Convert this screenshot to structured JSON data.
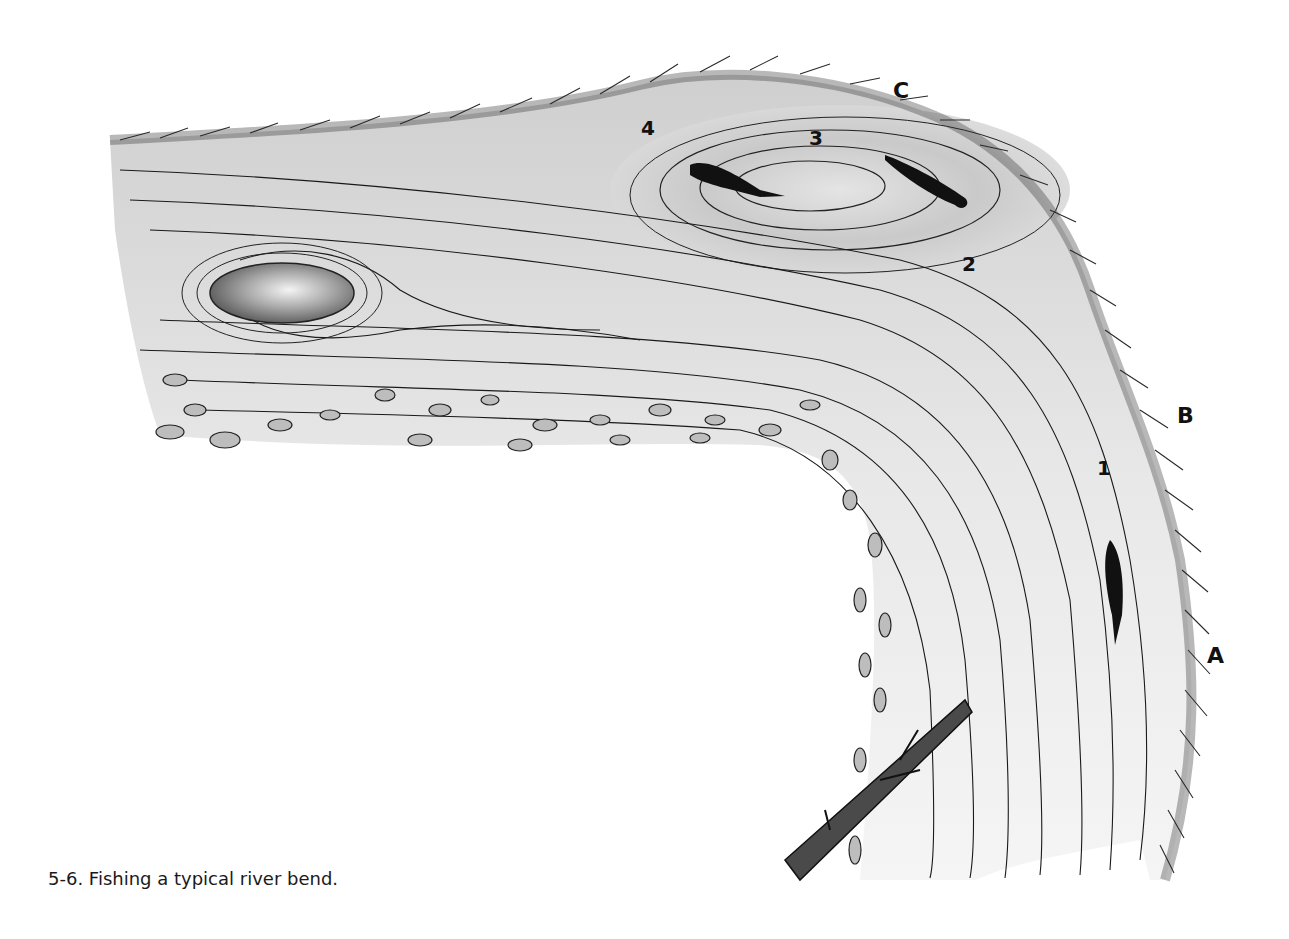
{
  "figure": {
    "caption": "5-6. Fishing a typical river bend.",
    "bank_labels": [
      {
        "id": "A",
        "text": "A"
      },
      {
        "id": "B",
        "text": "B"
      },
      {
        "id": "C",
        "text": "C"
      }
    ],
    "position_labels": [
      {
        "id": "1",
        "text": "1"
      },
      {
        "id": "2",
        "text": "2"
      },
      {
        "id": "3",
        "text": "3"
      },
      {
        "id": "4",
        "text": "4"
      }
    ],
    "elements": {
      "boulder": "boulder-in-current",
      "gravel_bar": "gravel-bar-inside-bend",
      "log": "submerged-log",
      "fish_count": 3,
      "eddy": "eddy-pool-outside-bend"
    },
    "colors": {
      "ink": "#111111",
      "water_shade": "#d6d6d6",
      "water_light": "#efefef",
      "grass": "#2a2a2a",
      "background": "#ffffff"
    }
  }
}
